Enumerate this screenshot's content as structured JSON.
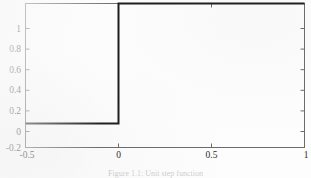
{
  "figure": {
    "background_color": "#fdfdfd",
    "axis_color": "#6b6b6b",
    "line_color": "#1c1c1c",
    "tick_label_color": "#2a2a2a"
  },
  "caption": {
    "text": "Figure 1.1: Unit step function"
  },
  "chart_data": {
    "type": "line",
    "title": "",
    "xlabel": "",
    "ylabel": "",
    "xlim": [
      -0.5,
      1
    ],
    "ylim": [
      -0.2,
      1
    ],
    "xticks": [
      -0.5,
      0,
      0.5,
      1
    ],
    "xticklabels": [
      "-0.5",
      "0",
      "0.5",
      "1"
    ],
    "yticks": [
      -0.2,
      0,
      0.2,
      0.4,
      0.6,
      0.8,
      1
    ],
    "yticklabels": [
      "-0.2",
      "0",
      "0.2",
      "0.4",
      "0.6",
      "0.8",
      "1"
    ],
    "grid": false,
    "legend": null,
    "series": [
      {
        "name": "unit step",
        "line_color": "#1c1c1c",
        "line_width": 2,
        "x": [
          -0.5,
          0,
          0,
          1
        ],
        "y": [
          0,
          0,
          1,
          1
        ]
      }
    ],
    "annotations": []
  }
}
